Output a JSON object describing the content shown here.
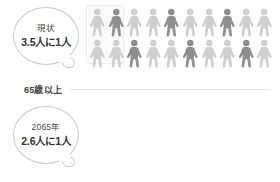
{
  "diagram": {
    "title_label": "65歳以上",
    "panels": [
      {
        "id": "current",
        "bubble": {
          "label": "現状",
          "value": "3.5人に1人",
          "ratio_denominator": 3.5
        },
        "pictogram": {
          "columns": 10,
          "rows": 2,
          "total_figures": 20,
          "highlighted_count": 6,
          "highlighted_indices": [
            1,
            4,
            7,
            12,
            15,
            18
          ],
          "figure_color_base": "#cfcfcf",
          "figure_color_highlight": "#8f8f8f"
        }
      },
      {
        "id": "future",
        "bubble": {
          "label": "2065年",
          "value": "2.6人に1人",
          "ratio_denominator": 2.6
        },
        "pictogram": {
          "columns": 10,
          "rows": 2,
          "total_figures": 20,
          "highlighted_count": 8,
          "highlighted_indices": [
            1,
            3,
            6,
            8,
            12,
            15,
            17,
            19
          ],
          "figure_color_base": "#cfcfcf",
          "figure_color_highlight": "#8f8f8f"
        }
      }
    ],
    "colors": {
      "background": "#ffffff",
      "bubble_border": "#c9c9c9",
      "text_primary": "#333333",
      "text_secondary": "#4a4a4a",
      "divider_line": "#e4e4e4",
      "figure_light": "#cfcfcf",
      "figure_dark": "#8f8f8f"
    }
  }
}
